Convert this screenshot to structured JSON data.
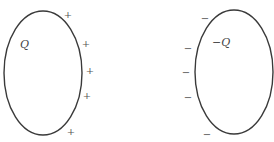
{
  "diagram": {
    "conductors": [
      {
        "id": "left",
        "label": "Q",
        "ellipse": {
          "cx": 43,
          "cy": 73,
          "rx": 39,
          "ry": 62
        },
        "label_pos": {
          "x": 20,
          "y": 48
        },
        "charge_symbol": "+",
        "charges": [
          {
            "x": 68,
            "y": 18
          },
          {
            "x": 86,
            "y": 47
          },
          {
            "x": 90,
            "y": 74
          },
          {
            "x": 87,
            "y": 99
          },
          {
            "x": 71,
            "y": 135
          }
        ]
      },
      {
        "id": "right",
        "label": "−Q",
        "ellipse": {
          "cx": 234,
          "cy": 72,
          "rx": 39,
          "ry": 62
        },
        "label_pos": {
          "x": 212,
          "y": 46
        },
        "charge_symbol": "−",
        "charges": [
          {
            "x": 205,
            "y": 22
          },
          {
            "x": 188,
            "y": 52
          },
          {
            "x": 186,
            "y": 76
          },
          {
            "x": 188,
            "y": 101
          },
          {
            "x": 207,
            "y": 138
          }
        ]
      }
    ]
  },
  "colors": {
    "stroke": "#3a3a3a",
    "text": "#444444",
    "background": "#ffffff"
  }
}
